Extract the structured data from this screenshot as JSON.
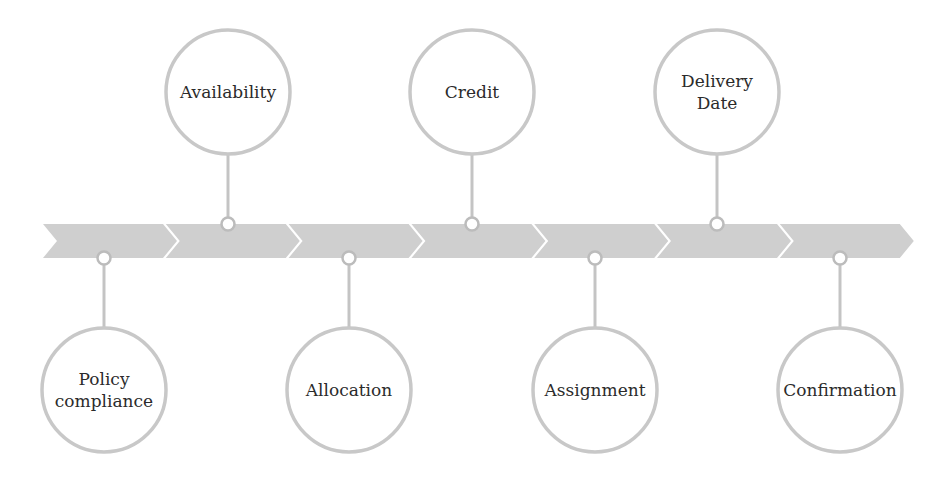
{
  "diagram": {
    "type": "timeline",
    "colors": {
      "chevron_fill": "#cfcfcf",
      "circle_stroke": "#c8c8c8",
      "connector": "#c4c4c4",
      "dot_stroke": "#bcbcbc",
      "text": "#2b2b2b",
      "background": "#ffffff"
    },
    "chevron_count": 7,
    "steps": [
      {
        "label_lines": [
          "Policy",
          "compliance"
        ],
        "position": "bottom"
      },
      {
        "label_lines": [
          "Availability"
        ],
        "position": "top"
      },
      {
        "label_lines": [
          "Allocation"
        ],
        "position": "bottom"
      },
      {
        "label_lines": [
          "Credit"
        ],
        "position": "top"
      },
      {
        "label_lines": [
          "Assignment"
        ],
        "position": "bottom"
      },
      {
        "label_lines": [
          "Delivery",
          "Date"
        ],
        "position": "top"
      },
      {
        "label_lines": [
          "Confirmation"
        ],
        "position": "bottom"
      }
    ]
  }
}
